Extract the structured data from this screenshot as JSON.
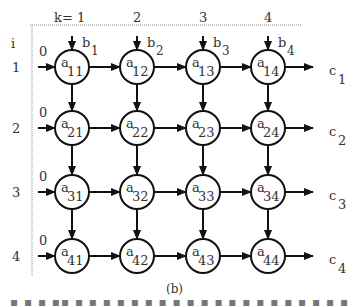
{
  "figure": {
    "caption": "(b)",
    "truncated_text": "...",
    "col_header_prefix": "k= ",
    "row_header": "i",
    "columns": [
      {
        "k": "1",
        "b": "b",
        "b_sub": "1"
      },
      {
        "k": "2",
        "b": "b",
        "b_sub": "2"
      },
      {
        "k": "3",
        "b": "b",
        "b_sub": "3"
      },
      {
        "k": "4",
        "b": "b",
        "b_sub": "4"
      }
    ],
    "rows": [
      {
        "i": "1",
        "input": "0",
        "c": "c",
        "c_sub": "1",
        "cells": [
          {
            "a": "a",
            "sub": "11"
          },
          {
            "a": "a",
            "sub": "12"
          },
          {
            "a": "a",
            "sub": "13"
          },
          {
            "a": "a",
            "sub": "14"
          }
        ]
      },
      {
        "i": "2",
        "input": "0",
        "c": "c",
        "c_sub": "2",
        "cells": [
          {
            "a": "a",
            "sub": "21"
          },
          {
            "a": "a",
            "sub": "22"
          },
          {
            "a": "a",
            "sub": "23"
          },
          {
            "a": "a",
            "sub": "24"
          }
        ]
      },
      {
        "i": "3",
        "input": "0",
        "c": "c",
        "c_sub": "3",
        "cells": [
          {
            "a": "a",
            "sub": "31"
          },
          {
            "a": "a",
            "sub": "32"
          },
          {
            "a": "a",
            "sub": "33"
          },
          {
            "a": "a",
            "sub": "34"
          }
        ]
      },
      {
        "i": "4",
        "input": "0",
        "c": "c",
        "c_sub": "4",
        "cells": [
          {
            "a": "a",
            "sub": "41"
          },
          {
            "a": "a",
            "sub": "42"
          },
          {
            "a": "a",
            "sub": "43"
          },
          {
            "a": "a",
            "sub": "44"
          }
        ]
      }
    ]
  }
}
